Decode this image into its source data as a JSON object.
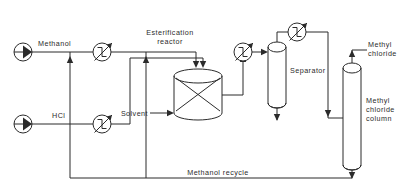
{
  "diagram": {
    "type": "process-flow-diagram",
    "background_color": "#ffffff",
    "line_color": "#2b2b2b"
  },
  "labels": {
    "methanol_feed": "Methanol",
    "hcl_feed": "HCl",
    "esterification_reactor_line1": "Esterification",
    "esterification_reactor_line2": "reactor",
    "solvent": "Solvent",
    "separator": "Separator",
    "methyl_chloride_line1": "Methyl",
    "methyl_chloride_line2": "chloride",
    "methyl_chloride_column_line1": "Methyl",
    "methyl_chloride_column_line2": "chloride",
    "methyl_chloride_column_line3": "column",
    "methanol_recycle": "Methanol recycle"
  },
  "equipment": [
    {
      "id": "methanol-pump",
      "name": "Methanol feed pump",
      "symbol": "centrifugal-pump"
    },
    {
      "id": "hcl-pump",
      "name": "HCl feed pump",
      "symbol": "centrifugal-pump"
    },
    {
      "id": "methanol-heater",
      "name": "Methanol preheater",
      "symbol": "heat-exchanger"
    },
    {
      "id": "hcl-heater",
      "name": "HCl preheater",
      "symbol": "heat-exchanger"
    },
    {
      "id": "esterification-reactor",
      "name": "Esterification reactor",
      "symbol": "packed-vessel"
    },
    {
      "id": "reactor-effluent-cooler",
      "name": "Reactor effluent cooler",
      "symbol": "heat-exchanger"
    },
    {
      "id": "separator-vessel",
      "name": "Separator",
      "symbol": "vertical-drum"
    },
    {
      "id": "overhead-condenser",
      "name": "Separator overhead condenser",
      "symbol": "heat-exchanger"
    },
    {
      "id": "methyl-chloride-column",
      "name": "Methyl chloride column",
      "symbol": "distillation-column"
    }
  ],
  "streams": [
    {
      "id": "methanol-feed",
      "label": "Methanol"
    },
    {
      "id": "hcl-feed",
      "label": "HCl"
    },
    {
      "id": "solvent-feed",
      "label": "Solvent"
    },
    {
      "id": "methyl-chloride-product",
      "label": "Methyl chloride"
    },
    {
      "id": "methanol-recycle",
      "label": "Methanol recycle"
    }
  ]
}
